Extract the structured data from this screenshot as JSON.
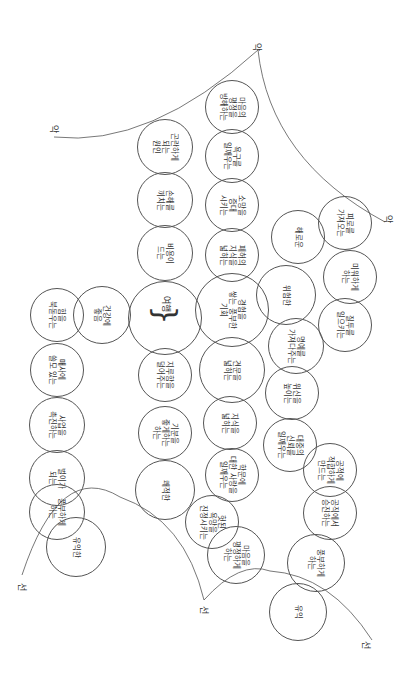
{
  "diagram": {
    "orientation": "rotated-90-clockwise",
    "center": {
      "label": "여행",
      "x": 165,
      "y": 318,
      "r": 37
    },
    "nodes": [
      {
        "id": "n1",
        "label": "건강에\n좋음",
        "x": 102,
        "y": 315,
        "r": 29
      },
      {
        "id": "n2",
        "label": "힘을\n북돋우는",
        "x": 57,
        "y": 315,
        "r": 27
      },
      {
        "id": "n3",
        "label": "매사에\n쓸모 있는",
        "x": 57,
        "y": 370,
        "r": 27
      },
      {
        "id": "n4",
        "label": "사업을\n촉진하는",
        "x": 57,
        "y": 425,
        "r": 28
      },
      {
        "id": "n5",
        "label": "벌이가\n되는",
        "x": 57,
        "y": 478,
        "r": 28
      },
      {
        "id": "n6",
        "label": "풍부하게\n하는",
        "x": 57,
        "y": 512,
        "r": 28
      },
      {
        "id": "n7",
        "label": "유익한",
        "x": 76,
        "y": 547,
        "r": 30
      },
      {
        "id": "n8",
        "label": "비용이\n드는",
        "x": 165,
        "y": 253,
        "r": 28
      },
      {
        "id": "n9",
        "label": "손해를\n끼치는",
        "x": 165,
        "y": 200,
        "r": 28
      },
      {
        "id": "n10",
        "label": "곤란하게\n되는\n원인",
        "x": 165,
        "y": 147,
        "r": 28
      },
      {
        "id": "n11",
        "label": "지루함을\n덜어주는",
        "x": 165,
        "y": 375,
        "r": 27
      },
      {
        "id": "n12",
        "label": "기분을\n좋게하는\n하는",
        "x": 165,
        "y": 433,
        "r": 27
      },
      {
        "id": "n13",
        "label": "쾌적한",
        "x": 165,
        "y": 490,
        "r": 30
      },
      {
        "id": "n14",
        "label": "마음의\n평정을\n방해하는",
        "x": 232,
        "y": 107,
        "r": 27
      },
      {
        "id": "n15",
        "label": "욕구를\n일깨우는",
        "x": 232,
        "y": 156,
        "r": 27
      },
      {
        "id": "n16",
        "label": "소망을\n증대\n시키는",
        "x": 232,
        "y": 205,
        "r": 27
      },
      {
        "id": "n17",
        "label": "폐허의\n지식을\n넓히는",
        "x": 232,
        "y": 255,
        "r": 27
      },
      {
        "id": "n18",
        "label": "경험을\n쌓는 풍부한\n기회",
        "x": 232,
        "y": 310,
        "r": 37
      },
      {
        "id": "n19",
        "label": "견문을\n넓히는",
        "x": 232,
        "y": 370,
        "r": 33
      },
      {
        "id": "n20",
        "label": "지식을\n넓히는",
        "x": 230,
        "y": 423,
        "r": 27
      },
      {
        "id": "n21",
        "label": "학문에\n대한 사랑을\n일깨우는",
        "x": 232,
        "y": 475,
        "r": 27
      },
      {
        "id": "n22",
        "label": "헛된\n욕망을\n진정시키는",
        "x": 212,
        "y": 522,
        "r": 27
      },
      {
        "id": "n23",
        "label": "마음을\n평정하게\n하는",
        "x": 236,
        "y": 555,
        "r": 29
      },
      {
        "id": "n24",
        "label": "해로운",
        "x": 298,
        "y": 237,
        "r": 27
      },
      {
        "id": "n25",
        "label": "위험한",
        "x": 286,
        "y": 295,
        "r": 30
      },
      {
        "id": "n26",
        "label": "명예를\n가져다주는",
        "x": 296,
        "y": 346,
        "r": 28
      },
      {
        "id": "n27",
        "label": "위신을\n높이는",
        "x": 292,
        "y": 393,
        "r": 27
      },
      {
        "id": "n28",
        "label": "대중의\n신뢰를\n일깨우는",
        "x": 290,
        "y": 445,
        "r": 27
      },
      {
        "id": "n29",
        "label": "공적에\n적합하게\n만드는",
        "x": 330,
        "y": 470,
        "r": 27
      },
      {
        "id": "n30",
        "label": "공직에서\n승진하는",
        "x": 330,
        "y": 513,
        "r": 27
      },
      {
        "id": "n31",
        "label": "풍부하게\n하는",
        "x": 316,
        "y": 563,
        "r": 29
      },
      {
        "id": "n32",
        "label": "유익",
        "x": 298,
        "y": 612,
        "r": 29
      },
      {
        "id": "n33",
        "label": "피로를\n가져오는",
        "x": 345,
        "y": 223,
        "r": 27
      },
      {
        "id": "n34",
        "label": "미워하게\n하는",
        "x": 350,
        "y": 277,
        "r": 27
      },
      {
        "id": "n35",
        "label": "질투를\n일으키는",
        "x": 345,
        "y": 325,
        "r": 27
      }
    ],
    "curve_labels": [
      {
        "text": "악",
        "x": 50,
        "y": 122
      },
      {
        "text": "악",
        "x": 253,
        "y": 40
      },
      {
        "text": "악",
        "x": 384,
        "y": 212
      },
      {
        "text": "선",
        "x": 18,
        "y": 580
      },
      {
        "text": "선",
        "x": 200,
        "y": 603
      },
      {
        "text": "선",
        "x": 362,
        "y": 638
      }
    ],
    "colors": {
      "line": "#555555",
      "text": "#333333",
      "background": "#ffffff"
    }
  }
}
